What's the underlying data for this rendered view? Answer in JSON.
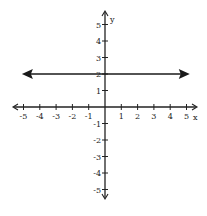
{
  "chart_data": {
    "type": "line",
    "title": "",
    "xlabel": "x",
    "ylabel": "y",
    "xlim": [
      -5,
      5
    ],
    "ylim": [
      -5,
      5
    ],
    "grid": false,
    "x_ticks": [
      -5,
      -4,
      -3,
      -2,
      -1,
      1,
      2,
      3,
      4,
      5
    ],
    "y_ticks": [
      -5,
      -4,
      -3,
      -2,
      -1,
      1,
      2,
      3,
      4,
      5
    ],
    "series": [
      {
        "name": "y = 2",
        "x": [
          -5.1,
          5.2
        ],
        "y": [
          2,
          2
        ],
        "arrows": "both"
      }
    ],
    "legend": null
  },
  "colors": {
    "axis": "#222222",
    "line": "#1a1a1a",
    "background": "#ffffff"
  }
}
